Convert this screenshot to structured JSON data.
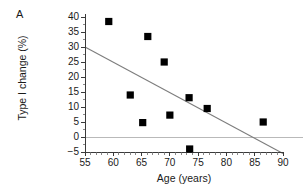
{
  "figure": {
    "panel_label": "A",
    "background_color": "#ffffff"
  },
  "chart_data": {
    "type": "scatter",
    "title": "",
    "xlabel": "Age (years)",
    "ylabel": "Type I change (%)",
    "xlim": [
      55,
      90
    ],
    "ylim": [
      -5,
      40
    ],
    "xticks": [
      55,
      60,
      65,
      70,
      75,
      80,
      85,
      90
    ],
    "xtick_labels": [
      "55",
      "60",
      "65",
      "70",
      "75",
      "80",
      "85",
      "90"
    ],
    "yticks": [
      -5,
      0,
      5,
      10,
      15,
      20,
      25,
      30,
      35,
      40
    ],
    "ytick_labels": [
      "−5",
      "0",
      "5",
      "10",
      "15",
      "20",
      "25",
      "30",
      "35",
      "40"
    ],
    "grid": false,
    "legend": null,
    "marker_style": "filled-square",
    "marker_color": "#000000",
    "x": [
      59.2,
      63.0,
      65.2,
      66.1,
      69.0,
      70.0,
      73.4,
      73.5,
      76.6,
      86.5
    ],
    "y": [
      38.5,
      14.0,
      4.8,
      33.5,
      25.0,
      7.3,
      13.1,
      -4.0,
      9.5,
      5.0
    ],
    "points": [
      {
        "age": 59.2,
        "change": 38.5
      },
      {
        "age": 63.0,
        "change": 14.0
      },
      {
        "age": 65.2,
        "change": 4.8
      },
      {
        "age": 66.1,
        "change": 33.5
      },
      {
        "age": 69.0,
        "change": 25.0
      },
      {
        "age": 70.0,
        "change": 7.3
      },
      {
        "age": 73.4,
        "change": 13.1
      },
      {
        "age": 73.5,
        "change": -4.0
      },
      {
        "age": 76.6,
        "change": 9.5
      },
      {
        "age": 86.5,
        "change": 5.0
      }
    ],
    "annotations": [
      {
        "name": "regression-line",
        "type": "line",
        "color": "#7d7d7d",
        "x0": 55.0,
        "y0": 30.0,
        "x1": 90.0,
        "y1": -5.5
      },
      {
        "name": "zero-reference-line",
        "type": "hline",
        "color": "#b9b9b9",
        "y": 0.0,
        "x0": 55.0,
        "x1": 90.0
      }
    ]
  }
}
